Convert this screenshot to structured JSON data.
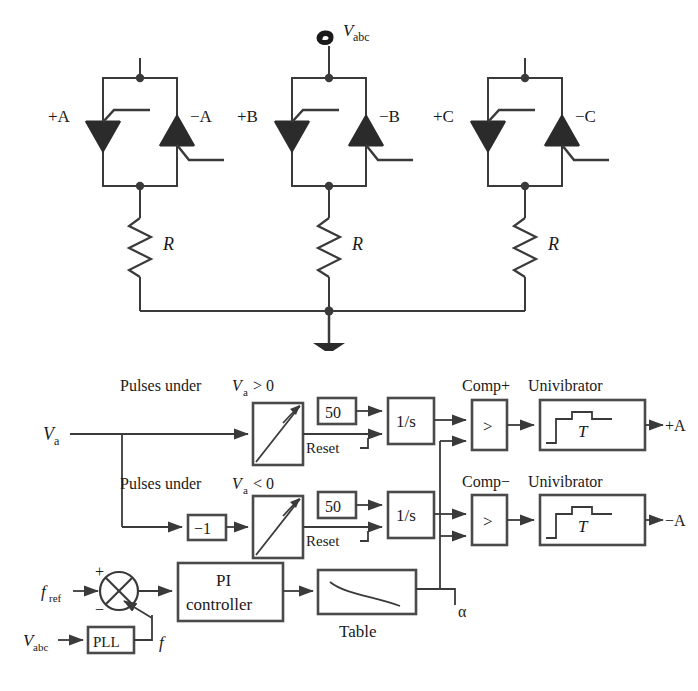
{
  "figure": {
    "colors": {
      "line": "#3a3a3a",
      "device_fill": "#2b2b2b",
      "block_border": "#4a4a4a",
      "text": "#1a1a1a",
      "background": "#ffffff"
    }
  },
  "power_circuit": {
    "source": {
      "symbol": "ac-source-sine",
      "label": "V",
      "sub": "abc"
    },
    "ground": {
      "symbol": "ground-icon"
    },
    "phases": [
      {
        "name": "A",
        "positive_gate_label": "+A",
        "negative_gate_label": "−A",
        "resistor_label": "R",
        "resistor_symbol": "zigzag-resistor"
      },
      {
        "name": "B",
        "positive_gate_label": "+B",
        "negative_gate_label": "−B",
        "resistor_label": "R",
        "resistor_symbol": "zigzag-resistor"
      },
      {
        "name": "C",
        "positive_gate_label": "+C",
        "negative_gate_label": "−C",
        "resistor_label": "R",
        "resistor_symbol": "zigzag-resistor"
      }
    ]
  },
  "control_diagram": {
    "input_signal": {
      "label": "V",
      "sub": "a"
    },
    "rows": [
      {
        "id": "positive",
        "caption_prefix": "Pulses under ",
        "caption_var": "V",
        "caption_sub": "a",
        "caption_suffix": " > 0",
        "ramp_block": "ramp-generator",
        "gain_value": "50",
        "integrator_label": "1/s",
        "reset_label": "Reset",
        "comparator_title": "Comp+",
        "comparator_symbol": ">",
        "univibrator_title": "Univibrator",
        "univibrator_label": "T",
        "output_label": "+A"
      },
      {
        "id": "negative",
        "caption_prefix": "Pulses under ",
        "caption_var": "V",
        "caption_sub": "a",
        "caption_suffix": " < 0",
        "inverter_gain": "−1",
        "ramp_block": "ramp-generator",
        "gain_value": "50",
        "integrator_label": "1/s",
        "reset_label": "Reset",
        "comparator_title": "Comp−",
        "comparator_symbol": ">",
        "univibrator_title": "Univibrator",
        "univibrator_label": "T",
        "output_label": "−A"
      }
    ],
    "pll_loop": {
      "reference_label": "f",
      "reference_sub": "ref",
      "sum_plus": "+",
      "sum_minus": "−",
      "sum_symbol": "summing-junction-cross",
      "controller_line1": "PI",
      "controller_line2": "controller",
      "table_label": "Table",
      "table_curve": "decreasing-curve",
      "alpha_label": "α",
      "pll_input_label": "V",
      "pll_input_sub": "abc",
      "pll_block_label": "PLL",
      "pll_output_label": "f"
    }
  }
}
